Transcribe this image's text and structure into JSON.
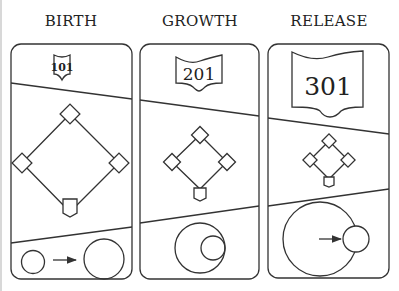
{
  "diagram": {
    "panels": [
      {
        "title": "BIRTH",
        "badge": "101",
        "stage": "birth",
        "bottom_caption": "small circle arrow to larger circle"
      },
      {
        "title": "GROWTH",
        "badge": "201",
        "stage": "growth",
        "bottom_caption": "small circle inside larger circle"
      },
      {
        "title": "RELEASE",
        "badge": "301",
        "stage": "release",
        "bottom_caption": "large circle with arrow pointing to small circle outside"
      }
    ],
    "colors": {
      "stroke": "#333333",
      "background": "#ffffff",
      "text": "#222222"
    }
  }
}
